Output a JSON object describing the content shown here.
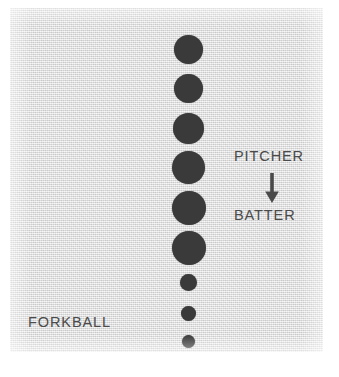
{
  "figure": {
    "caption_label": "FORKBALL",
    "background_color": "#e6e6e6",
    "ink_color": "#3a3a3a",
    "text_color": "#4a4a4a"
  },
  "annotations": {
    "pitcher_label": "PITCHER",
    "batter_label": "BATTER",
    "arrow_direction": "down",
    "arrow_icon_name": "arrow-down-icon"
  },
  "chart_data": {
    "type": "scatter",
    "title": "FORKBALL",
    "xlabel": "",
    "ylabel": "",
    "xlim": [
      0,
      313
    ],
    "ylim": [
      0,
      344
    ],
    "grid": false,
    "legend": "none",
    "series": [
      {
        "name": "ball positions",
        "points": [
          {
            "index": 1,
            "x": 164,
            "y": 27,
            "diameter": 29
          },
          {
            "index": 2,
            "x": 164,
            "y": 66,
            "diameter": 29
          },
          {
            "index": 3,
            "x": 163,
            "y": 105,
            "diameter": 31
          },
          {
            "index": 4,
            "x": 162,
            "y": 143,
            "diameter": 33
          },
          {
            "index": 5,
            "x": 162,
            "y": 183,
            "diameter": 34
          },
          {
            "index": 6,
            "x": 162,
            "y": 223,
            "diameter": 34
          },
          {
            "index": 7,
            "x": 170,
            "y": 266,
            "diameter": 17
          },
          {
            "index": 8,
            "x": 171,
            "y": 298,
            "diameter": 15
          },
          {
            "index": 9,
            "x": 172,
            "y": 327,
            "diameter": 13
          }
        ]
      }
    ]
  }
}
